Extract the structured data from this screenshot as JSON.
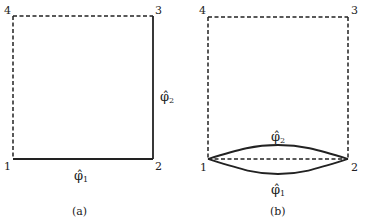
{
  "diagram": {
    "colors": {
      "line": "#222222",
      "background": "#ffffff"
    },
    "panels": [
      {
        "id": "a",
        "caption": "(a)",
        "corners": [
          {
            "label": "1",
            "x": 13,
            "y": 159
          },
          {
            "label": "2",
            "x": 153,
            "y": 159
          },
          {
            "label": "3",
            "x": 153,
            "y": 16
          },
          {
            "label": "4",
            "x": 13,
            "y": 16
          }
        ],
        "edges": [
          {
            "from": "1",
            "to": "2",
            "style": "solid",
            "label": "φ̂₁"
          },
          {
            "from": "2",
            "to": "3",
            "style": "solid",
            "label": "φ̂₂"
          },
          {
            "from": "3",
            "to": "4",
            "style": "dashed"
          },
          {
            "from": "4",
            "to": "1",
            "style": "dashed"
          }
        ],
        "labels": {
          "phi1": {
            "base": "φ̂",
            "sub": "1"
          },
          "phi2": {
            "base": "φ̂",
            "sub": "2"
          }
        }
      },
      {
        "id": "b",
        "caption": "(b)",
        "corners": [
          {
            "label": "1",
            "x": 208,
            "y": 159
          },
          {
            "label": "2",
            "x": 348,
            "y": 159
          },
          {
            "label": "3",
            "x": 348,
            "y": 17
          },
          {
            "label": "4",
            "x": 208,
            "y": 17
          }
        ],
        "edges": [
          {
            "from": "1",
            "to": "2",
            "style": "dashed"
          },
          {
            "from": "2",
            "to": "3",
            "style": "dashed"
          },
          {
            "from": "3",
            "to": "4",
            "style": "dashed"
          },
          {
            "from": "4",
            "to": "1",
            "style": "dashed"
          },
          {
            "from": "1",
            "to": "2",
            "style": "solid-curve-upper",
            "label": "φ̂₂"
          },
          {
            "from": "1",
            "to": "2",
            "style": "solid-curve-lower",
            "label": "φ̂₁"
          }
        ],
        "labels": {
          "phi1": {
            "base": "φ̂",
            "sub": "1"
          },
          "phi2": {
            "base": "φ̂",
            "sub": "2"
          }
        }
      }
    ]
  }
}
